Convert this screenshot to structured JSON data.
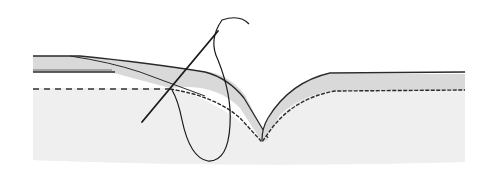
{
  "illustration": {
    "subject": "hand-stitching-fold-diagram",
    "colors": {
      "background": "#ffffff",
      "fabric_base": "#efefef",
      "fold_fill": "#d9d9d9",
      "outline": "#2a2a2a",
      "thread": "#1a1a1a",
      "dashed_line": "#333333"
    },
    "elements": [
      "fabric-base",
      "folded-edge",
      "stitch-line",
      "dashed-guide-line",
      "needle",
      "thread-loop"
    ]
  }
}
